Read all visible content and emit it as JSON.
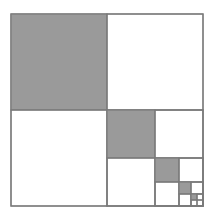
{
  "diagram": {
    "outer": {
      "x": 11,
      "y": 14,
      "size": 192
    },
    "levels": 5,
    "colors": {
      "shade": "#9a9a9a",
      "line": "#7a7a7a",
      "background": "#ffffff"
    }
  }
}
